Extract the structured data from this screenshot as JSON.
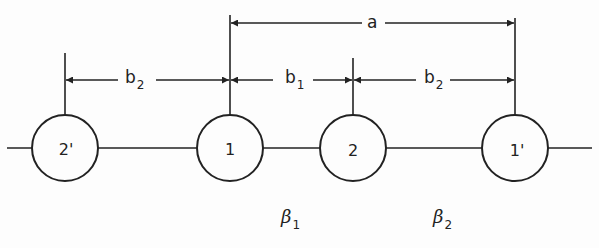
{
  "diagram": {
    "type": "linear-chain-of-sites",
    "nodes": [
      {
        "id": "2'",
        "label": "2'",
        "cx": 65
      },
      {
        "id": "1",
        "label": "1",
        "cx": 230
      },
      {
        "id": "2",
        "label": "2",
        "cx": 353
      },
      {
        "id": "1'",
        "label": "1'",
        "cx": 515
      }
    ],
    "dimensions": [
      {
        "label": "a",
        "from": "1",
        "to": "1'"
      },
      {
        "label": "b",
        "subscript": "2",
        "from": "2'",
        "to": "1"
      },
      {
        "label": "b",
        "subscript": "1",
        "from": "1",
        "to": "2"
      },
      {
        "label": "b",
        "subscript": "2",
        "from": "2",
        "to": "1'"
      }
    ],
    "bonds": [
      {
        "label": "β",
        "subscript": "1"
      },
      {
        "label": "β",
        "subscript": "2"
      }
    ]
  }
}
